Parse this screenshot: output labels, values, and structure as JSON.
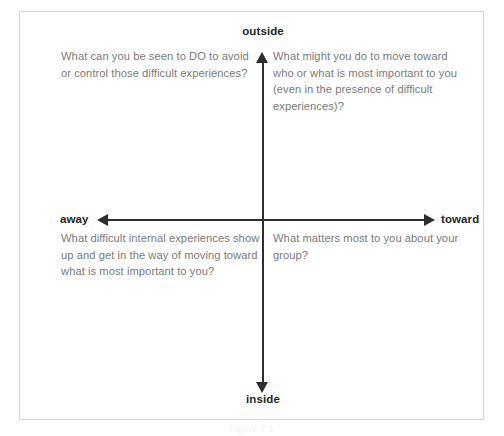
{
  "diagram": {
    "axes": {
      "vertical": {
        "top_label": "outside",
        "bottom_label": "inside"
      },
      "horizontal": {
        "left_label": "away",
        "right_label": "toward"
      }
    },
    "quadrants": {
      "top_left": "What can you be seen to DO to avoid or control those difficult experiences?",
      "top_right": "What might you do to move toward who or what is most important to you (even in the presence of difficult experiences)?",
      "bottom_left": "What difficult internal experiences show up and get in the way of moving toward what is most important to you?",
      "bottom_right": "What matters most to you about your group?"
    },
    "caption": "Figure 7.1"
  },
  "colors": {
    "frame_border": "#d8d8d8",
    "axis": "#2e2e2e",
    "pole_label_text": "#262626",
    "quadrant_text": "#7b7b7b",
    "background": "#ffffff"
  }
}
